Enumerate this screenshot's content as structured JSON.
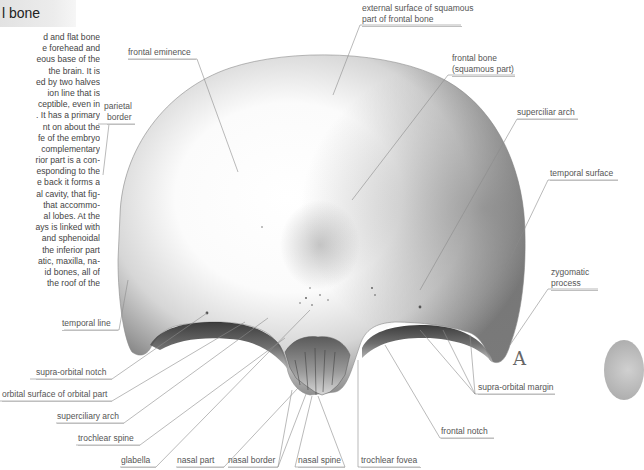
{
  "header": {
    "title": "l bone"
  },
  "body_text": [
    "d and flat bone",
    "e forehead and",
    "eous base of the",
    "the brain. It is",
    "ed by two halves",
    "ion line that is",
    "ceptible, even in",
    ". It has a primary",
    "nt on about the",
    "fe of the embryo",
    "complementary",
    "rior part is a con-",
    "esponding to the",
    "e back it forms a",
    "al cavity, that fig-",
    "that accommo-",
    "al lobes. At the",
    "ays is linked with",
    "and sphenoidal",
    "the inferior part",
    "atic, maxilla, na-",
    "id bones, all of",
    "the roof of the"
  ],
  "figure": {
    "letter": "A",
    "labels": {
      "external_surface": [
        "external surface of squamous",
        "part of frontal bone"
      ],
      "frontal_eminence": "frontal eminence",
      "parietal_border": [
        "parietal",
        "border"
      ],
      "frontal_bone": [
        "frontal bone",
        "(squamous part)"
      ],
      "superciliar_arch": "superciliar arch",
      "temporal_surface": "temporal surface",
      "zygomatic_process": [
        "zygomatic",
        "process"
      ],
      "temporal_line": "temporal line",
      "supra_orbital_notch": "supra-orbital notch",
      "orbital_surface": "orbital surface of orbital part",
      "superciliary_arch": "superciliary arch",
      "trochlear_spine": "trochlear spine",
      "glabella": "glabella",
      "nasal_part": "nasal part",
      "nasal_border": "nasal border",
      "nasal_spine": "nasal spine",
      "trochlear_fovea": "trochlear fovea",
      "frontal_notch": "frontal notch",
      "supra_orbital_margin": "supra-orbital margin"
    }
  }
}
